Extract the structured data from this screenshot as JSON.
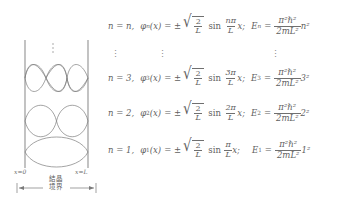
{
  "figure": {
    "type": "physics-diagram",
    "diagram": {
      "left_boundary_label": "x=0",
      "right_boundary_label": "x=L",
      "region_label_line1": "結晶",
      "region_label_line2": "境界",
      "ellipsis": "⋮",
      "wave_modes": [
        {
          "n": 3,
          "lobes": 3,
          "label": "n = 3"
        },
        {
          "n": 2,
          "lobes": 2,
          "label": "n = 2"
        },
        {
          "n": 1,
          "lobes": 1,
          "label": "n = 1"
        }
      ],
      "wall_color": "#9a9a9a",
      "wave_color": "#7d7d7d",
      "arrow_color": "#7a7a7a"
    },
    "equations": {
      "row_n": {
        "n_label": "n = n,",
        "phi": "φ",
        "phi_sub": "n",
        "phi_arg": "(x)",
        "equals": "= ±",
        "root_num": "2",
        "root_den": "L",
        "sin": "sin",
        "sin_num": "nπ",
        "sin_den": "L",
        "sin_var": "x;",
        "energy": "E",
        "energy_sub": "n",
        "energy_equals": "=",
        "energy_num": "π²ℏ²",
        "energy_den": "2mL²",
        "energy_factor": "n²"
      },
      "row_dots": {
        "col1": "⋮",
        "col2": "⋮",
        "col3": "⋮"
      },
      "row_3": {
        "n_label": "n = 3,",
        "phi": "φ",
        "phi_sub": "3",
        "phi_arg": "(x)",
        "equals": "= ±",
        "root_num": "2",
        "root_den": "L",
        "sin": "sin",
        "sin_num": "3π",
        "sin_den": "L",
        "sin_var": "x;",
        "energy": "E",
        "energy_sub": "3",
        "energy_equals": "=",
        "energy_num": "π²ℏ²",
        "energy_den": "2mL²",
        "energy_factor": "3²"
      },
      "row_2": {
        "n_label": "n = 2,",
        "phi": "φ",
        "phi_sub": "2",
        "phi_arg": "(x)",
        "equals": "= ±",
        "root_num": "2",
        "root_den": "L",
        "sin": "sin",
        "sin_num": "2π",
        "sin_den": "L",
        "sin_var": "x;",
        "energy": "E",
        "energy_sub": "2",
        "energy_equals": "=",
        "energy_num": "π²ℏ²",
        "energy_den": "2mL²",
        "energy_factor": "2²"
      },
      "row_1": {
        "n_label": "n = 1,",
        "phi": "φ",
        "phi_sub": "1",
        "phi_arg": "(x)",
        "equals": "= ±",
        "root_num": "2",
        "root_den": "L",
        "sin": "sin",
        "sin_num": "π",
        "sin_den": "L",
        "sin_var": "x;",
        "energy": "E",
        "energy_sub": "1",
        "energy_equals": "=",
        "energy_num": "π²ℏ²",
        "energy_den": "2mL²",
        "energy_factor": "1²"
      }
    }
  }
}
